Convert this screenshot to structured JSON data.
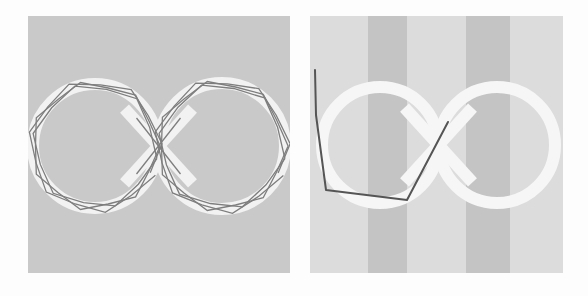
{
  "figure": {
    "background": "#fdfdfd",
    "panels": [
      {
        "id": "left",
        "description": "figure-eight track with zigzag polygon trajectories overlaid",
        "box": {
          "x": 28,
          "y": 16,
          "w": 262,
          "h": 257
        },
        "bg_color": "#c9c9c9",
        "track_color": "#f2f2f2",
        "track_width": 12,
        "loops": [
          {
            "cx": 95,
            "cy": 146,
            "r": 62
          },
          {
            "cx": 222,
            "cy": 146,
            "r": 63
          }
        ],
        "trajectory_color": "#6a6a6a"
      },
      {
        "id": "right",
        "description": "figure-eight track over striped background with a single piecewise trajectory",
        "box": {
          "x": 310,
          "y": 16,
          "w": 253,
          "h": 257
        },
        "bg_color": "#dcdcdc",
        "stripe_color": "#c4c4c4",
        "stripes": [
          {
            "x": 368,
            "w": 39
          },
          {
            "x": 466,
            "w": 44
          }
        ],
        "track_color": "#f6f6f6",
        "track_width": 12,
        "loops": [
          {
            "cx": 380,
            "cy": 145,
            "r": 58
          },
          {
            "cx": 497,
            "cy": 145,
            "r": 58
          }
        ],
        "trajectory_color": "#555555",
        "trajectory_points": [
          [
            315,
            70
          ],
          [
            316,
            115
          ],
          [
            326,
            190
          ],
          [
            407,
            200
          ],
          [
            448,
            122
          ]
        ]
      }
    ]
  }
}
